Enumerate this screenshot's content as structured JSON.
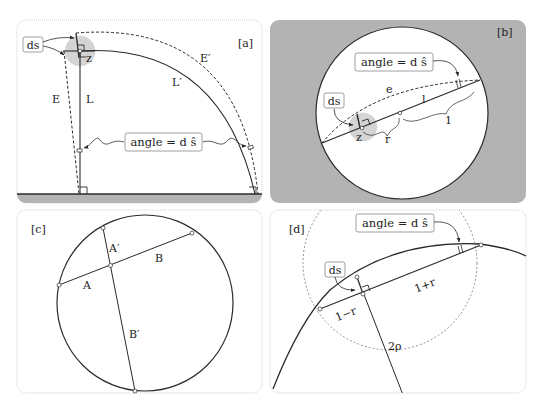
{
  "colors": {
    "ink": "#2a2a2a",
    "gray_fill": "#b3b3b3",
    "light_gray": "#d2d2d2",
    "panel_border": "#c8c8c8",
    "box_border": "#888888",
    "white": "#ffffff"
  },
  "panels": {
    "a": {
      "tag": "[a]",
      "labels": {
        "ds": "ds",
        "z": "z",
        "E": "E",
        "L": "L",
        "E_prime": "E′",
        "L_prime": "L′",
        "angle": "angle = d ŝ"
      }
    },
    "b": {
      "tag": "[b]",
      "labels": {
        "ds": "ds",
        "z": "z",
        "e": "e",
        "l": "l",
        "one": "1",
        "r": "r",
        "angle": "angle = d ŝ"
      }
    },
    "c": {
      "tag": "[c]",
      "labels": {
        "A": "A",
        "A_prime": "A′",
        "B": "B",
        "B_prime": "B′"
      }
    },
    "d": {
      "tag": "[d]",
      "labels": {
        "ds": "ds",
        "one_plus_r": "1+r",
        "one_minus_r": "1−r",
        "two_rho": "2ρ",
        "angle": "angle = d ŝ"
      }
    }
  }
}
